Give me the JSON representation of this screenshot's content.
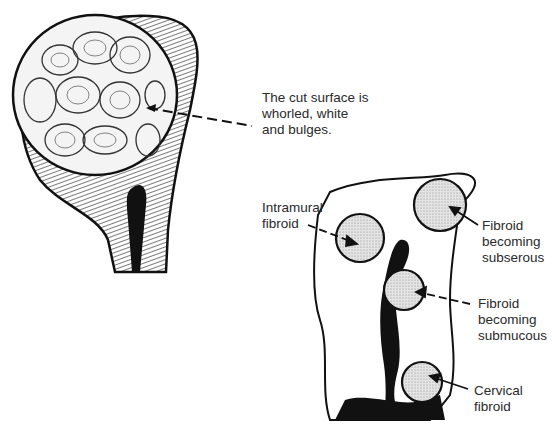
{
  "figure": {
    "left_panel": {
      "subject": "cut-surface-of-uterine-fibroid",
      "annotation": {
        "lines": [
          "The cut surface is",
          "whorled, white",
          "and bulges."
        ]
      }
    },
    "right_panel": {
      "subject": "uterus-section-with-fibroid-locations",
      "labels": [
        {
          "id": "intramural",
          "lines": [
            "Intramural",
            "fibroid"
          ]
        },
        {
          "id": "subserous",
          "lines": [
            "Fibroid",
            "becoming",
            "subserous"
          ]
        },
        {
          "id": "submucous",
          "lines": [
            "Fibroid",
            "becoming",
            "submucous"
          ]
        },
        {
          "id": "cervical",
          "lines": [
            "Cervical",
            "fibroid"
          ]
        }
      ]
    },
    "colors": {
      "ink": "#111111",
      "fibroid_fill": "#cfcfcf",
      "background": "#ffffff"
    }
  }
}
